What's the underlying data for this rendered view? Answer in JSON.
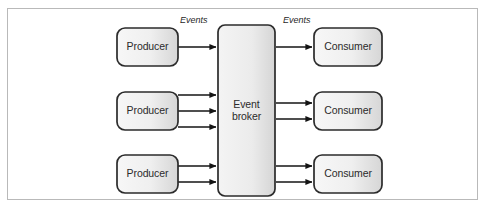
{
  "figure": {
    "type": "block-diagram",
    "frame": {
      "border_color": "#b9b9b9",
      "background": "#ffffff"
    },
    "palette": {
      "node_fill_light": "#f2f2f2",
      "node_fill_dark": "#d9d9d9",
      "node_stroke": "#2b2b2b",
      "arrow_color": "#1a1a1a",
      "text_color": "#2b2b2b",
      "frame_stroke": "#b9b9b9"
    },
    "nodes": [
      {
        "id": "producer-top",
        "label": "Producer",
        "role": "producer",
        "x": 117,
        "y": 28,
        "w": 61,
        "h": 38
      },
      {
        "id": "producer-middle",
        "label": "Producer",
        "role": "producer",
        "x": 117,
        "y": 92,
        "w": 61,
        "h": 38
      },
      {
        "id": "producer-bottom",
        "label": "Producer",
        "role": "producer",
        "x": 117,
        "y": 155,
        "w": 61,
        "h": 38
      },
      {
        "id": "event-broker",
        "label": "Event broker",
        "label_line1": "Event",
        "label_line2": "broker",
        "role": "broker",
        "x": 218,
        "y": 25,
        "w": 57,
        "h": 171
      },
      {
        "id": "consumer-top",
        "label": "Consumer",
        "role": "consumer",
        "x": 314,
        "y": 28,
        "w": 68,
        "h": 38
      },
      {
        "id": "consumer-middle",
        "label": "Consumer",
        "role": "consumer",
        "x": 314,
        "y": 92,
        "w": 68,
        "h": 38
      },
      {
        "id": "consumer-bottom",
        "label": "Consumer",
        "role": "consumer",
        "x": 314,
        "y": 155,
        "w": 68,
        "h": 38
      }
    ],
    "edge_labels": [
      {
        "id": "events-in",
        "text": "Events",
        "x": 180,
        "y": 15
      },
      {
        "id": "events-out",
        "text": "Events",
        "x": 283,
        "y": 15
      }
    ],
    "edges": [
      {
        "from": "producer-top",
        "to": "event-broker",
        "y": 47
      },
      {
        "from": "producer-middle",
        "to": "event-broker",
        "y": 95
      },
      {
        "from": "producer-middle",
        "to": "event-broker",
        "y": 111
      },
      {
        "from": "producer-middle",
        "to": "event-broker",
        "y": 127
      },
      {
        "from": "producer-bottom",
        "to": "event-broker",
        "y": 166
      },
      {
        "from": "producer-bottom",
        "to": "event-broker",
        "y": 182
      },
      {
        "from": "event-broker",
        "to": "consumer-top",
        "y": 47
      },
      {
        "from": "event-broker",
        "to": "consumer-middle",
        "y": 103
      },
      {
        "from": "event-broker",
        "to": "consumer-middle",
        "y": 119
      },
      {
        "from": "event-broker",
        "to": "consumer-bottom",
        "y": 166
      },
      {
        "from": "event-broker",
        "to": "consumer-bottom",
        "y": 182
      }
    ]
  }
}
